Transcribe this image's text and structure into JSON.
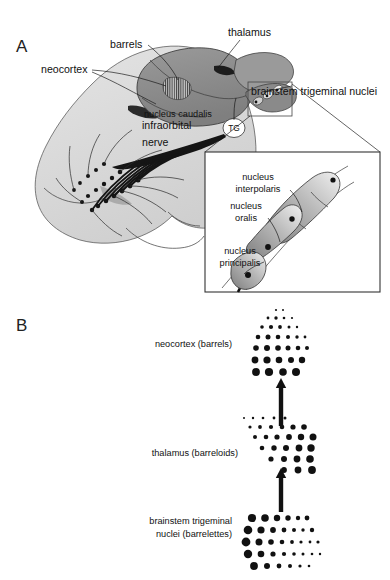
{
  "figure": {
    "panels": [
      {
        "letter": "A",
        "x": 16,
        "y": 46
      },
      {
        "letter": "B",
        "x": 16,
        "y": 325
      }
    ]
  },
  "panel_a": {
    "labels": [
      {
        "id": "thalamus",
        "text": "thalamus",
        "x": 228,
        "y": 36,
        "anchor": "start",
        "size": "big"
      },
      {
        "id": "barrels",
        "text": "barrels",
        "x": 110,
        "y": 48,
        "anchor": "start",
        "size": "big"
      },
      {
        "id": "neocortex",
        "text": "neocortex",
        "x": 41,
        "y": 73,
        "anchor": "start",
        "size": "big"
      },
      {
        "id": "nucleus-caudalis",
        "text": "nucleus caudalis",
        "x": 144,
        "y": 117,
        "anchor": "start",
        "size": "small"
      },
      {
        "id": "infraorbital-nerve-1",
        "text": "infraorbital",
        "x": 142,
        "y": 129,
        "anchor": "start",
        "size": "big"
      },
      {
        "id": "infraorbital-nerve-2",
        "text": "nerve",
        "x": 142,
        "y": 146,
        "anchor": "start",
        "size": "big"
      },
      {
        "id": "trigeminal-ganglion",
        "text": "TG",
        "x": 234,
        "y": 131,
        "anchor": "middle",
        "size": "tg"
      },
      {
        "id": "brainstem-nuclei",
        "text": "brainstem trigeminal nuclei",
        "x": 251,
        "y": 95,
        "anchor": "start",
        "size": "big"
      }
    ],
    "inset": {
      "box": {
        "x": 205,
        "y": 152,
        "width": 175,
        "height": 140
      },
      "labels": [
        {
          "id": "nucleus-interpolaris-1",
          "text": "nucleus",
          "x": 258,
          "y": 180,
          "anchor": "middle"
        },
        {
          "id": "nucleus-interpolaris-2",
          "text": "interpolaris",
          "x": 258,
          "y": 192,
          "anchor": "middle"
        },
        {
          "id": "nucleus-oralis-1",
          "text": "nucleus",
          "x": 246,
          "y": 209,
          "anchor": "middle"
        },
        {
          "id": "nucleus-oralis-2",
          "text": "oralis",
          "x": 246,
          "y": 221,
          "anchor": "middle"
        },
        {
          "id": "nucleus-principalis-1",
          "text": "nucleus",
          "x": 240,
          "y": 254,
          "anchor": "middle"
        },
        {
          "id": "nucleus-principalis-2",
          "text": "principalis",
          "x": 240,
          "y": 266,
          "anchor": "middle"
        }
      ]
    }
  },
  "panel_b": {
    "labels": [
      {
        "id": "neocortex-barrels",
        "lines": [
          "neocortex (barrels)"
        ],
        "x": 232,
        "y": 347,
        "anchor": "end"
      },
      {
        "id": "thalamus-barreloids",
        "lines": [
          "thalamus (barreloids)"
        ],
        "x": 238,
        "y": 456,
        "anchor": "end"
      },
      {
        "id": "brainstem-nuclei",
        "lines": [
          "brainstem trigeminal",
          "nuclei (barrelettes)"
        ],
        "x": 232,
        "y": 530,
        "anchor": "end"
      }
    ],
    "arrows": [
      {
        "id": "arrow-thalamus-to-cortex",
        "x": 281,
        "y1": 426,
        "y2": 378
      },
      {
        "id": "arrow-brainstem-to-thalamus",
        "x": 281,
        "y1": 512,
        "y2": 468
      }
    ],
    "clusters": {
      "barrels": {
        "origin": {
          "x": 252,
          "y": 310
        },
        "rows": [
          {
            "dy": 0,
            "dots": [
              {
                "dx": 24,
                "r": 1.1
              },
              {
                "dx": 31,
                "r": 1.0
              }
            ]
          },
          {
            "dy": 8,
            "dots": [
              {
                "dx": 16,
                "r": 1.4
              },
              {
                "dx": 24,
                "r": 1.7
              },
              {
                "dx": 32,
                "r": 1.3
              },
              {
                "dx": 40,
                "r": 1.1
              }
            ]
          },
          {
            "dy": 17,
            "dots": [
              {
                "dx": 10,
                "r": 1.8
              },
              {
                "dx": 19,
                "r": 2.1
              },
              {
                "dx": 28,
                "r": 1.9
              },
              {
                "dx": 37,
                "r": 1.5
              },
              {
                "dx": 45,
                "r": 1.2
              }
            ]
          },
          {
            "dy": 27,
            "dots": [
              {
                "dx": 6,
                "r": 2.3
              },
              {
                "dx": 16,
                "r": 2.5
              },
              {
                "dx": 26,
                "r": 2.3
              },
              {
                "dx": 36,
                "r": 2.0
              },
              {
                "dx": 45,
                "r": 1.7
              },
              {
                "dx": 53,
                "r": 1.4
              }
            ]
          },
          {
            "dy": 38,
            "dots": [
              {
                "dx": 4,
                "r": 2.8
              },
              {
                "dx": 15,
                "r": 3.0
              },
              {
                "dx": 26,
                "r": 2.8
              },
              {
                "dx": 36,
                "r": 2.5
              },
              {
                "dx": 46,
                "r": 2.3
              },
              {
                "dx": 55,
                "r": 2.0
              }
            ]
          },
          {
            "dy": 50,
            "dots": [
              {
                "dx": 3,
                "r": 3.4
              },
              {
                "dx": 15,
                "r": 3.6
              },
              {
                "dx": 27,
                "r": 3.3
              },
              {
                "dx": 39,
                "r": 3.0
              },
              {
                "dx": 50,
                "r": 3.2
              }
            ]
          },
          {
            "dy": 62,
            "dots": [
              {
                "dx": 4,
                "r": 3.9
              },
              {
                "dx": 17,
                "r": 4.1
              },
              {
                "dx": 31,
                "r": 3.8
              },
              {
                "dx": 44,
                "r": 4.0
              }
            ]
          }
        ]
      },
      "barreloids": {
        "origin": {
          "x": 244,
          "y": 418
        },
        "rows": [
          {
            "dy": 0,
            "dx0": 0,
            "dots": [
              {
                "dx": 0,
                "r": 1.0
              },
              {
                "dx": 9,
                "r": 1.2
              },
              {
                "dx": 19,
                "r": 1.3
              },
              {
                "dx": 30,
                "r": 1.4
              },
              {
                "dx": 41,
                "r": 1.5
              }
            ]
          },
          {
            "dy": 9,
            "dx0": 4,
            "dots": [
              {
                "dx": 2,
                "r": 1.6
              },
              {
                "dx": 12,
                "r": 1.9
              },
              {
                "dx": 23,
                "r": 2.1
              },
              {
                "dx": 34,
                "r": 2.3
              },
              {
                "dx": 45,
                "r": 2.6
              },
              {
                "dx": 56,
                "r": 2.8
              }
            ]
          },
          {
            "dy": 19,
            "dx0": 8,
            "dots": [
              {
                "dx": 3,
                "r": 2.0
              },
              {
                "dx": 14,
                "r": 2.3
              },
              {
                "dx": 25,
                "r": 2.6
              },
              {
                "dx": 37,
                "r": 2.9
              },
              {
                "dx": 49,
                "r": 3.2
              },
              {
                "dx": 61,
                "r": 3.5
              }
            ]
          },
          {
            "dy": 30,
            "dx0": 13,
            "dots": [
              {
                "dx": 5,
                "r": 2.3
              },
              {
                "dx": 17,
                "r": 2.7
              },
              {
                "dx": 29,
                "r": 3.0
              },
              {
                "dx": 42,
                "r": 3.4
              },
              {
                "dx": 54,
                "r": 3.7
              }
            ]
          },
          {
            "dy": 41,
            "dx0": 20,
            "dots": [
              {
                "dx": 7,
                "r": 2.6
              },
              {
                "dx": 20,
                "r": 3.0
              },
              {
                "dx": 33,
                "r": 3.4
              },
              {
                "dx": 46,
                "r": 3.8
              }
            ]
          },
          {
            "dy": 52,
            "dx0": 30,
            "dots": [
              {
                "dx": 10,
                "r": 2.9
              },
              {
                "dx": 24,
                "r": 3.4
              },
              {
                "dx": 38,
                "r": 3.9
              }
            ]
          }
        ]
      },
      "barrelettes": {
        "origin": {
          "x": 246,
          "y": 518
        },
        "rows": [
          {
            "dy": 0,
            "dots": [
              {
                "dx": 6,
                "r": 4.1
              },
              {
                "dx": 19,
                "r": 3.8
              },
              {
                "dx": 31,
                "r": 3.2
              },
              {
                "dx": 42,
                "r": 2.7
              },
              {
                "dx": 52,
                "r": 2.2
              },
              {
                "dx": 61,
                "r": 2.4
              }
            ]
          },
          {
            "dy": 12,
            "dots": [
              {
                "dx": 2,
                "r": 4.3
              },
              {
                "dx": 15,
                "r": 3.6
              },
              {
                "dx": 27,
                "r": 2.9
              },
              {
                "dx": 38,
                "r": 2.4
              },
              {
                "dx": 48,
                "r": 2.0
              },
              {
                "dx": 57,
                "r": 1.7
              },
              {
                "dx": 66,
                "r": 2.2
              }
            ]
          },
          {
            "dy": 24,
            "dots": [
              {
                "dx": 0,
                "r": 4.4
              },
              {
                "dx": 13,
                "r": 3.5
              },
              {
                "dx": 25,
                "r": 2.8
              },
              {
                "dx": 36,
                "r": 2.3
              },
              {
                "dx": 46,
                "r": 1.9
              },
              {
                "dx": 55,
                "r": 1.6
              },
              {
                "dx": 64,
                "r": 1.4
              },
              {
                "dx": 72,
                "r": 1.6
              }
            ]
          },
          {
            "dy": 36,
            "dots": [
              {
                "dx": 2,
                "r": 4.2
              },
              {
                "dx": 15,
                "r": 3.3
              },
              {
                "dx": 27,
                "r": 2.6
              },
              {
                "dx": 38,
                "r": 2.1
              },
              {
                "dx": 48,
                "r": 1.8
              },
              {
                "dx": 57,
                "r": 1.5
              },
              {
                "dx": 66,
                "r": 1.3
              },
              {
                "dx": 74,
                "r": 1.2
              }
            ]
          },
          {
            "dy": 48,
            "dots": [
              {
                "dx": 8,
                "r": 3.9
              },
              {
                "dx": 21,
                "r": 3.0
              },
              {
                "dx": 33,
                "r": 2.4
              },
              {
                "dx": 44,
                "r": 2.0
              },
              {
                "dx": 54,
                "r": 1.6
              },
              {
                "dx": 63,
                "r": 1.3
              }
            ]
          }
        ]
      }
    }
  },
  "colors": {
    "brain": "#8c8c8c",
    "brain_dark": "#6e6e6e",
    "head": "#dcdcdc",
    "head_shadow": "#c6c6c6",
    "ink": "#111111",
    "outline": "#3a3a3a",
    "background": "#ffffff"
  }
}
